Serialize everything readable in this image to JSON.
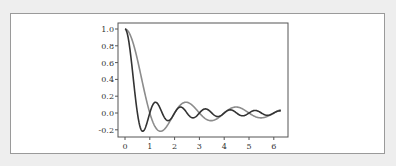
{
  "chart_data": {
    "type": "line",
    "title": "",
    "xlabel": "",
    "ylabel": "",
    "xlim": [
      0,
      6.6
    ],
    "ylim": [
      -0.26,
      1.08
    ],
    "grid": false,
    "legend": null,
    "x_ticks": [
      0,
      1,
      2,
      3,
      4,
      5,
      6
    ],
    "x_tick_labels": [
      "0",
      "1",
      "2",
      "3",
      "4",
      "5",
      "6"
    ],
    "y_ticks": [
      1.0,
      0.8,
      0.6,
      0.4,
      0.2,
      0.0,
      -0.2
    ],
    "y_tick_labels": [
      "1.0",
      "0.8",
      "0.6",
      "0.4",
      "0.2",
      "0.0",
      "-0.2"
    ],
    "x_range": [
      0,
      6.2832
    ],
    "series": [
      {
        "name": "sin(πx)/(πx)",
        "color": "#8c8c8c",
        "k": 3.14159,
        "sample_points": {
          "x": [
            0,
            0.5,
            1.0,
            1.43,
            2.0,
            2.46,
            3.0,
            3.47,
            4.0,
            4.48,
            5.0,
            5.49,
            6.0,
            6.28
          ],
          "y": [
            1.0,
            0.637,
            0.0,
            -0.217,
            0.0,
            0.128,
            0.0,
            -0.091,
            0.0,
            0.071,
            0.0,
            -0.058,
            0.0,
            -0.045
          ]
        }
      },
      {
        "name": "sin(2πx)/(2πx)",
        "color": "#333333",
        "k": 6.28318,
        "sample_points": {
          "x": [
            0,
            0.25,
            0.5,
            0.715,
            1.0,
            1.23,
            1.5,
            1.74,
            2.0,
            2.24,
            2.5,
            2.75,
            3.0,
            3.5,
            4.0,
            4.5,
            5.0,
            5.5,
            6.0,
            6.28
          ],
          "y": [
            1.0,
            0.637,
            0.0,
            -0.217,
            0.0,
            0.128,
            0.0,
            -0.091,
            0.0,
            0.071,
            0.0,
            -0.058,
            0.0,
            0.0,
            0.0,
            0.0,
            0.0,
            0.0,
            0.0,
            0.0
          ]
        }
      }
    ]
  },
  "layout": {
    "plot_left": 118,
    "plot_top": 23,
    "plot_right": 288,
    "plot_bottom": 137,
    "x0_px": 125,
    "px_per_x": 24.8,
    "y0_px": 113,
    "px_per_y": 84
  }
}
